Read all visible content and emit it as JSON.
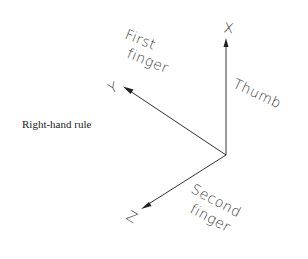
{
  "caption": "Right-hand rule",
  "axes": {
    "x": {
      "label": "X",
      "description": "Thumb"
    },
    "y": {
      "label": "Y",
      "description_line1": "First",
      "description_line2": "finger"
    },
    "z": {
      "label": "Z",
      "description_line1": "Second",
      "description_line2": "finger"
    }
  },
  "colors": {
    "line": "#333333",
    "background": "#ffffff"
  }
}
